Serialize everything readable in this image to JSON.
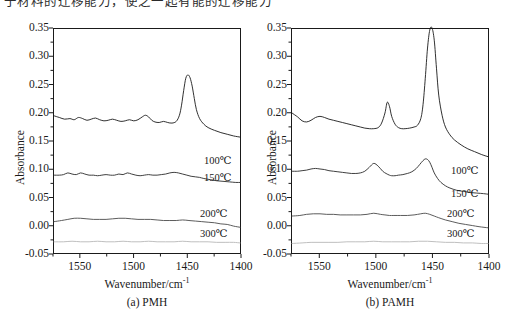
{
  "top_text": {
    "clipped_line": "于材料的迁移能力，使之一起有能的迁移能力"
  },
  "figure": {
    "y_axis_label": "Absorbance",
    "x_axis_label_prefix": "Wavenumber/cm",
    "x_axis_label_sup": "-1",
    "y_ticks": [
      "0.35",
      "0.30",
      "0.25",
      "0.20",
      "0.15",
      "0.10",
      "0.05",
      "0.00",
      "-0.05"
    ],
    "x_ticks": [
      "1550",
      "1500",
      "1450",
      "1400"
    ],
    "series_labels": [
      "100℃",
      "150℃",
      "200℃",
      "300℃"
    ],
    "panels": [
      {
        "id": "a",
        "caption": "(a) PMH"
      },
      {
        "id": "b",
        "caption": "(b) PAMH"
      }
    ]
  },
  "colors": {
    "axis": "#1a1a1a",
    "curve_100": "#1a1a1a",
    "curve_150": "#2a2a2a",
    "curve_200": "#4a4a4a",
    "curve_300": "#b8b8b8",
    "background": "#ffffff"
  },
  "chart_data": {
    "type": "line",
    "title": "",
    "xlabel": "Wavenumber/cm-1",
    "ylabel": "Absorbance",
    "xlim": [
      1575,
      1400
    ],
    "ylim": [
      -0.05,
      0.35
    ],
    "x_reversed": true,
    "grid": false,
    "legend": "inline-right-of-curve",
    "panels": [
      {
        "name": "(a) PMH",
        "series": [
          {
            "name": "100℃",
            "color": "#1a1a1a",
            "x": [
              1575,
              1570,
              1565,
              1560,
              1556,
              1552,
              1548,
              1544,
              1540,
              1536,
              1532,
              1528,
              1524,
              1520,
              1516,
              1512,
              1508,
              1504,
              1500,
              1496,
              1492,
              1489,
              1486,
              1483,
              1480,
              1476,
              1472,
              1468,
              1464,
              1460,
              1457,
              1455,
              1453,
              1451,
              1449,
              1447,
              1445,
              1443,
              1441,
              1438,
              1434,
              1430,
              1424,
              1418,
              1412,
              1406,
              1400
            ],
            "y": [
              0.195,
              0.192,
              0.189,
              0.19,
              0.188,
              0.192,
              0.19,
              0.187,
              0.189,
              0.191,
              0.188,
              0.186,
              0.187,
              0.189,
              0.187,
              0.185,
              0.186,
              0.188,
              0.186,
              0.188,
              0.193,
              0.196,
              0.193,
              0.187,
              0.184,
              0.183,
              0.185,
              0.183,
              0.182,
              0.185,
              0.196,
              0.214,
              0.24,
              0.262,
              0.268,
              0.263,
              0.248,
              0.226,
              0.206,
              0.19,
              0.18,
              0.174,
              0.169,
              0.165,
              0.162,
              0.159,
              0.157
            ]
          },
          {
            "name": "150℃",
            "color": "#2a2a2a",
            "x": [
              1575,
              1570,
              1566,
              1562,
              1558,
              1554,
              1550,
              1546,
              1542,
              1538,
              1534,
              1530,
              1526,
              1522,
              1518,
              1514,
              1510,
              1506,
              1502,
              1498,
              1494,
              1490,
              1486,
              1482,
              1478,
              1474,
              1470,
              1466,
              1462,
              1458,
              1454,
              1450,
              1446,
              1442,
              1438,
              1434,
              1428,
              1422,
              1416,
              1410,
              1404,
              1400
            ],
            "y": [
              0.089,
              0.089,
              0.09,
              0.093,
              0.091,
              0.09,
              0.093,
              0.091,
              0.089,
              0.089,
              0.088,
              0.089,
              0.09,
              0.089,
              0.089,
              0.091,
              0.09,
              0.093,
              0.091,
              0.089,
              0.088,
              0.089,
              0.09,
              0.089,
              0.089,
              0.09,
              0.091,
              0.093,
              0.094,
              0.093,
              0.091,
              0.089,
              0.087,
              0.086,
              0.085,
              0.083,
              0.081,
              0.079,
              0.078,
              0.077,
              0.076,
              0.076
            ]
          },
          {
            "name": "200℃",
            "color": "#4a4a4a",
            "x": [
              1575,
              1568,
              1562,
              1556,
              1550,
              1544,
              1538,
              1532,
              1526,
              1520,
              1514,
              1508,
              1502,
              1496,
              1490,
              1484,
              1478,
              1472,
              1466,
              1460,
              1454,
              1448,
              1442,
              1436,
              1430,
              1424,
              1418,
              1412,
              1406,
              1400
            ],
            "y": [
              0.006,
              0.008,
              0.01,
              0.012,
              0.012,
              0.011,
              0.01,
              0.01,
              0.01,
              0.011,
              0.012,
              0.012,
              0.011,
              0.01,
              0.01,
              0.01,
              0.009,
              0.008,
              0.008,
              0.008,
              0.009,
              0.008,
              0.007,
              0.006,
              0.005,
              0.004,
              0.002,
              0.001,
              -0.002,
              -0.004
            ]
          },
          {
            "name": "300℃",
            "color": "#b8b8b8",
            "x": [
              1575,
              1566,
              1558,
              1550,
              1542,
              1534,
              1526,
              1518,
              1510,
              1502,
              1494,
              1486,
              1478,
              1470,
              1462,
              1454,
              1446,
              1438,
              1430,
              1422,
              1414,
              1406,
              1400
            ],
            "y": [
              -0.03,
              -0.03,
              -0.029,
              -0.03,
              -0.03,
              -0.029,
              -0.03,
              -0.03,
              -0.029,
              -0.03,
              -0.03,
              -0.029,
              -0.03,
              -0.03,
              -0.03,
              -0.029,
              -0.03,
              -0.03,
              -0.03,
              -0.031,
              -0.031,
              -0.031,
              -0.032
            ]
          }
        ]
      },
      {
        "name": "(b) PAMH",
        "series": [
          {
            "name": "100℃",
            "color": "#1a1a1a",
            "x": [
              1575,
              1570,
              1566,
              1562,
              1558,
              1554,
              1550,
              1546,
              1542,
              1538,
              1534,
              1530,
              1526,
              1522,
              1518,
              1514,
              1510,
              1506,
              1502,
              1498,
              1495,
              1492,
              1490,
              1488,
              1486,
              1483,
              1480,
              1477,
              1474,
              1470,
              1466,
              1463,
              1460,
              1458,
              1456,
              1454,
              1452,
              1450,
              1448,
              1446,
              1444,
              1441,
              1438,
              1434,
              1430,
              1424,
              1418,
              1412,
              1406,
              1400
            ],
            "y": [
              0.2,
              0.193,
              0.186,
              0.184,
              0.187,
              0.192,
              0.194,
              0.192,
              0.189,
              0.187,
              0.185,
              0.183,
              0.181,
              0.179,
              0.177,
              0.175,
              0.173,
              0.172,
              0.172,
              0.174,
              0.182,
              0.2,
              0.219,
              0.212,
              0.194,
              0.18,
              0.174,
              0.172,
              0.172,
              0.173,
              0.175,
              0.178,
              0.19,
              0.215,
              0.262,
              0.316,
              0.348,
              0.352,
              0.33,
              0.28,
              0.232,
              0.196,
              0.175,
              0.161,
              0.152,
              0.143,
              0.136,
              0.131,
              0.126,
              0.122
            ]
          },
          {
            "name": "150℃",
            "color": "#2a2a2a",
            "x": [
              1575,
              1570,
              1566,
              1562,
              1558,
              1554,
              1550,
              1546,
              1542,
              1538,
              1534,
              1530,
              1526,
              1522,
              1518,
              1514,
              1510,
              1506,
              1502,
              1498,
              1494,
              1491,
              1488,
              1486,
              1483,
              1480,
              1476,
              1472,
              1468,
              1464,
              1461,
              1458,
              1456,
              1454,
              1452,
              1450,
              1448,
              1445,
              1442,
              1438,
              1434,
              1428,
              1422,
              1416,
              1410,
              1404,
              1400
            ],
            "y": [
              0.096,
              0.096,
              0.097,
              0.098,
              0.1,
              0.101,
              0.1,
              0.099,
              0.097,
              0.096,
              0.095,
              0.094,
              0.093,
              0.092,
              0.092,
              0.093,
              0.096,
              0.103,
              0.11,
              0.105,
              0.096,
              0.092,
              0.089,
              0.088,
              0.088,
              0.089,
              0.09,
              0.092,
              0.095,
              0.101,
              0.108,
              0.115,
              0.118,
              0.117,
              0.112,
              0.103,
              0.093,
              0.083,
              0.076,
              0.07,
              0.066,
              0.062,
              0.06,
              0.058,
              0.057,
              0.056,
              0.055
            ]
          },
          {
            "name": "200℃",
            "color": "#4a4a4a",
            "x": [
              1575,
              1568,
              1562,
              1556,
              1550,
              1544,
              1538,
              1532,
              1526,
              1520,
              1514,
              1508,
              1502,
              1496,
              1492,
              1488,
              1484,
              1478,
              1472,
              1466,
              1460,
              1456,
              1452,
              1448,
              1444,
              1438,
              1432,
              1426,
              1420,
              1414,
              1408,
              1400
            ],
            "y": [
              0.016,
              0.017,
              0.019,
              0.02,
              0.02,
              0.019,
              0.019,
              0.018,
              0.018,
              0.018,
              0.018,
              0.019,
              0.021,
              0.019,
              0.018,
              0.017,
              0.017,
              0.017,
              0.017,
              0.018,
              0.02,
              0.021,
              0.019,
              0.016,
              0.013,
              0.009,
              0.006,
              0.003,
              0.001,
              -0.001,
              -0.003,
              -0.005
            ]
          },
          {
            "name": "300℃",
            "color": "#b8b8b8",
            "x": [
              1575,
              1566,
              1558,
              1550,
              1542,
              1534,
              1526,
              1518,
              1510,
              1502,
              1494,
              1486,
              1478,
              1470,
              1462,
              1454,
              1446,
              1438,
              1430,
              1422,
              1414,
              1406,
              1400
            ],
            "y": [
              -0.033,
              -0.032,
              -0.031,
              -0.031,
              -0.031,
              -0.031,
              -0.03,
              -0.03,
              -0.03,
              -0.029,
              -0.03,
              -0.03,
              -0.03,
              -0.03,
              -0.029,
              -0.029,
              -0.03,
              -0.031,
              -0.031,
              -0.032,
              -0.032,
              -0.033,
              -0.033
            ]
          }
        ]
      }
    ]
  }
}
